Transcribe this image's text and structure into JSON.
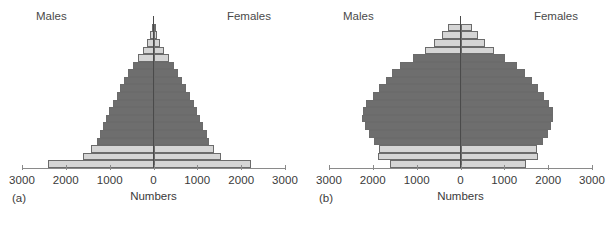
{
  "figure": {
    "width": 615,
    "height": 234,
    "background": "#ffffff",
    "dark_bar_color": "#6e6e6e",
    "light_bar_color": "#d5d5d5",
    "bar_outline_color": "#6b6b6b",
    "axis_color": "#8a8a8a",
    "centerline_color": "#4a4a4a"
  },
  "panels": [
    {
      "key": "a",
      "panel_label": "(a)",
      "males_label": "Males",
      "females_label": "Females",
      "axis_title": "Numbers",
      "tick_labels": [
        "3000",
        "2000",
        "1000",
        "0",
        "1000",
        "2000",
        "3000"
      ],
      "tick_values": [
        -3000,
        -2000,
        -1000,
        0,
        1000,
        2000,
        3000
      ]
    },
    {
      "key": "b",
      "panel_label": "(b)",
      "males_label": "Males",
      "females_label": "Females",
      "axis_title": "Numbers",
      "tick_labels": [
        "3000",
        "2000",
        "1000",
        "0",
        "1000",
        "2000",
        "3000"
      ],
      "tick_values": [
        -3000,
        -2000,
        -1000,
        0,
        1000,
        2000,
        3000
      ]
    }
  ],
  "chart_data": [
    {
      "type": "bar",
      "subtype": "population-pyramid",
      "panel": "a",
      "title": "",
      "panel_label": "(a)",
      "xlabel": "Numbers",
      "ylabel": "",
      "xlim": [
        -3000,
        3000
      ],
      "xticks": [
        -3000,
        -2000,
        -1000,
        0,
        1000,
        2000,
        3000
      ],
      "xticklabels": [
        "3000",
        "2000",
        "1000",
        "0",
        "1000",
        "2000",
        "3000"
      ],
      "grid": false,
      "legend": false,
      "annotations": [
        "Males",
        "Females"
      ],
      "shape": "expansive",
      "series": [
        {
          "name": "Males",
          "side": "left",
          "values": [
            2400,
            1620,
            1430,
            1300,
            1230,
            1160,
            1090,
            1010,
            930,
            840,
            760,
            670,
            580,
            470,
            360,
            250,
            150,
            80,
            40
          ]
        },
        {
          "name": "Females",
          "side": "right",
          "values": [
            2230,
            1540,
            1390,
            1270,
            1210,
            1140,
            1070,
            1000,
            920,
            830,
            750,
            660,
            570,
            460,
            350,
            245,
            145,
            78,
            38
          ]
        }
      ],
      "bar_shading": [
        "light",
        "light",
        "light",
        "dark",
        "dark",
        "dark",
        "dark",
        "dark",
        "dark",
        "dark",
        "dark",
        "dark",
        "dark",
        "dark",
        "light",
        "light",
        "light",
        "light",
        "light"
      ],
      "bar_order": "bottom-to-top"
    },
    {
      "type": "bar",
      "subtype": "population-pyramid",
      "panel": "b",
      "title": "",
      "panel_label": "(b)",
      "xlabel": "Numbers",
      "ylabel": "",
      "xlim": [
        -3000,
        3000
      ],
      "xticks": [
        -3000,
        -2000,
        -1000,
        0,
        1000,
        2000,
        3000
      ],
      "xticklabels": [
        "3000",
        "2000",
        "1000",
        "0",
        "1000",
        "2000",
        "3000"
      ],
      "grid": false,
      "legend": false,
      "annotations": [
        "Males",
        "Females"
      ],
      "shape": "stationary",
      "series": [
        {
          "name": "Males",
          "side": "left",
          "values": [
            1600,
            1880,
            1870,
            1980,
            2080,
            2180,
            2240,
            2230,
            2150,
            2000,
            1870,
            1700,
            1560,
            1380,
            1080,
            820,
            600,
            420,
            280
          ]
        },
        {
          "name": "Females",
          "side": "right",
          "values": [
            1490,
            1760,
            1740,
            1880,
            1990,
            2060,
            2120,
            2100,
            2030,
            1900,
            1770,
            1620,
            1470,
            1290,
            1010,
            770,
            560,
            390,
            260
          ]
        }
      ],
      "bar_shading": [
        "light",
        "light",
        "light",
        "dark",
        "dark",
        "dark",
        "dark",
        "dark",
        "dark",
        "dark",
        "dark",
        "dark",
        "dark",
        "dark",
        "dark",
        "light",
        "light",
        "light",
        "light"
      ],
      "bar_order": "bottom-to-top"
    }
  ]
}
